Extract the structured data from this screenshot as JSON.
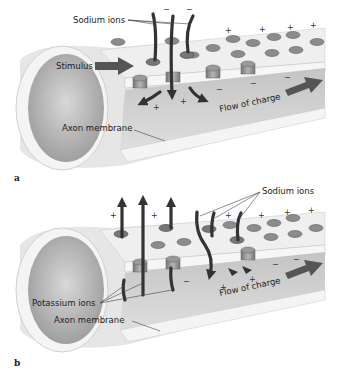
{
  "panels": [
    {
      "id": "a",
      "label": "a",
      "labels": {
        "sodium_ions": "Sodium ions",
        "stimulus": "Stimulus",
        "flow_of_charge": "Flow of charge",
        "axon_membrane": "Axon membrane"
      },
      "signs": {
        "plus": "+",
        "minus": "−"
      }
    },
    {
      "id": "b",
      "label": "b",
      "labels": {
        "sodium_ions": "Sodium ions",
        "potassium_ions": "Potassium ions",
        "flow_of_charge": "Flow of charge",
        "axon_membrane": "Axon membrane"
      },
      "signs": {
        "plus": "+",
        "minus": "−"
      }
    }
  ],
  "colors": {
    "membrane_outer": "#eeeeee",
    "membrane_inner": "#b8b8b8",
    "channel": "#8a8a8a",
    "arrow": "#3a3a3a",
    "text": "#222222"
  }
}
